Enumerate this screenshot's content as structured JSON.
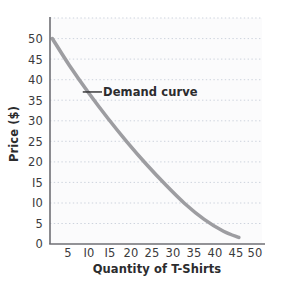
{
  "figure": {
    "background_color": "#ffffff",
    "plot_background_color": "#fbfbfc",
    "title_remnant": "",
    "axis_color": "#6f6f74",
    "grid_color": "#cdd3dd",
    "tick_text_color": "#3b3b3d",
    "axis_title_color": "#2c2c2e",
    "curve_color": "#9d9da1"
  },
  "axes": {
    "y_title": "Price ($)",
    "x_title": "Quantity of T-Shirts",
    "y_ticks": [
      "50",
      "45",
      "40",
      "35",
      "30",
      "25",
      "20",
      "I5",
      "I0",
      "5",
      "0"
    ],
    "x_ticks": [
      "5",
      "I0",
      "I5",
      "20",
      "25",
      "30",
      "35",
      "40",
      "45",
      "50"
    ]
  },
  "annotation": {
    "demand_curve_label": "Demand curve"
  },
  "chart_data": {
    "type": "line",
    "title": "",
    "xlabel": "Quantity of T-Shirts",
    "ylabel": "Price ($)",
    "xlim": [
      0,
      55
    ],
    "ylim": [
      0,
      55
    ],
    "xticks": [
      5,
      10,
      15,
      20,
      25,
      30,
      35,
      40,
      45,
      50
    ],
    "yticks": [
      0,
      5,
      10,
      15,
      20,
      25,
      30,
      35,
      40,
      45,
      50
    ],
    "grid": true,
    "grid_style": "dotted-horizontal",
    "legend": "none",
    "annotations": [
      {
        "text": "Demand curve",
        "x": 12,
        "y": 37,
        "leader_from": [
          13.5,
          37
        ],
        "leader_to": [
          8.5,
          37
        ]
      }
    ],
    "series": [
      {
        "name": "Demand curve",
        "color": "#9d9da1",
        "linewidth": 3.6,
        "x": [
          0.6,
          5,
          10,
          15,
          20,
          25,
          30,
          35,
          40,
          45,
          49
        ],
        "y": [
          50.0,
          43.5,
          36.8,
          30.6,
          24.8,
          19.4,
          14.4,
          9.8,
          6.0,
          3.1,
          1.6
        ]
      }
    ]
  }
}
